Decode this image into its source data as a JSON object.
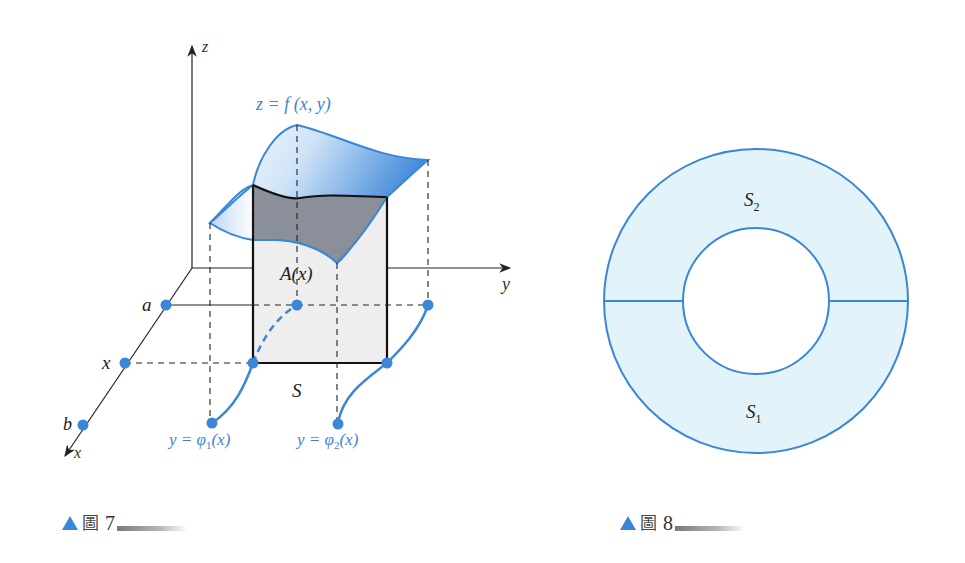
{
  "figure7": {
    "axes": {
      "z": "z",
      "y": "y",
      "x": "x"
    },
    "surface_label": "z = f (x, y)",
    "cross_section_label": "A(x)",
    "region_label": "S",
    "x_axis_points": [
      "a",
      "x",
      "b"
    ],
    "curve1_label_prefix": "y = ",
    "curve1_phi": "φ",
    "curve1_sub": "1",
    "curve1_suffix": "(x)",
    "curve2_label_prefix": "y = ",
    "curve2_phi": "φ",
    "curve2_sub": "2",
    "curve2_suffix": "(x)",
    "caption": {
      "glyph": "圖",
      "number": "7"
    }
  },
  "figure8": {
    "region_top": "S",
    "region_top_sub": "2",
    "region_bottom": "S",
    "region_bottom_sub": "1",
    "caption": {
      "glyph": "圖",
      "number": "8"
    }
  },
  "colors": {
    "accent_blue": "#3a86d8",
    "ring_fill": "#e3f3fa",
    "cross_section_dark": "#8a8f99",
    "rect_fill": "#eeeeef",
    "line": "#222222"
  }
}
